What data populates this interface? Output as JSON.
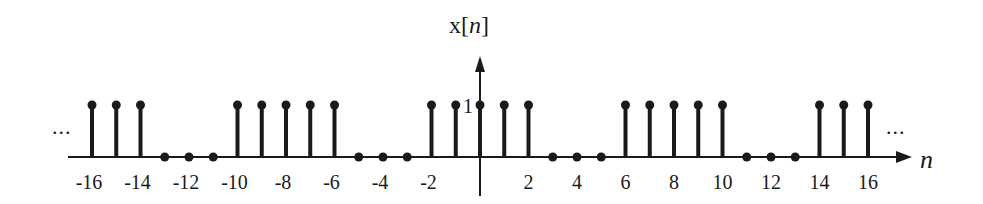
{
  "chart_data": {
    "type": "stem",
    "title": "x[n]",
    "xlabel": "n",
    "ylabel": "x[n]",
    "y_tick_label": "1",
    "x": [
      -16,
      -15,
      -14,
      -13,
      -12,
      -11,
      -10,
      -9,
      -8,
      -7,
      -6,
      -5,
      -4,
      -3,
      -2,
      -1,
      0,
      1,
      2,
      3,
      4,
      5,
      6,
      7,
      8,
      9,
      10,
      11,
      12,
      13,
      14,
      15,
      16
    ],
    "values": [
      1,
      1,
      1,
      0,
      0,
      0,
      1,
      1,
      1,
      1,
      1,
      0,
      0,
      0,
      1,
      1,
      1,
      1,
      1,
      0,
      0,
      0,
      1,
      1,
      1,
      1,
      1,
      0,
      0,
      0,
      1,
      1,
      1
    ],
    "x_tick_labels": [
      "-16",
      "-14",
      "-12",
      "-10",
      "-8",
      "-6",
      "-4",
      "-2",
      "2",
      "4",
      "6",
      "8",
      "10",
      "12",
      "14",
      "16"
    ],
    "x_tick_values": [
      -16,
      -14,
      -12,
      -10,
      -8,
      -6,
      -4,
      -2,
      2,
      4,
      6,
      8,
      10,
      12,
      14,
      16
    ],
    "continuation_marks": {
      "left": "...",
      "right": "..."
    },
    "period": 8,
    "grid": false
  },
  "labels": {
    "title_prefix": "x[",
    "title_var": "n",
    "title_suffix": "]",
    "x_axis_var": "n",
    "one": "1",
    "ellipsis": "..."
  }
}
